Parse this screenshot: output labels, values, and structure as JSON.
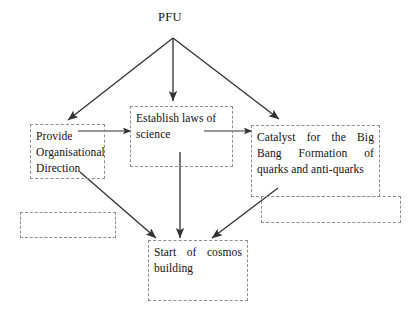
{
  "diagram": {
    "title": "PFU",
    "background_color": "#ffffff",
    "line_color": "#333333",
    "box_border_color": "#8d8d8d",
    "text_color": "#111111",
    "nodes": [
      {
        "id": "pfu",
        "label": "PFU"
      },
      {
        "id": "provide",
        "label": "Provide Organisational Direction"
      },
      {
        "id": "establish",
        "label": "Establish laws of science"
      },
      {
        "id": "catalyst",
        "label": "Catalyst for the Big Bang Formation of quarks and anti-quarks"
      },
      {
        "id": "start",
        "label": "Start of cosmos building"
      },
      {
        "id": "empty-left",
        "label": ""
      },
      {
        "id": "empty-right",
        "label": ""
      }
    ],
    "edges": [
      {
        "from": "pfu",
        "to": "provide"
      },
      {
        "from": "pfu",
        "to": "establish"
      },
      {
        "from": "pfu",
        "to": "catalyst"
      },
      {
        "from": "provide",
        "to": "establish"
      },
      {
        "from": "establish",
        "to": "catalyst"
      },
      {
        "from": "provide",
        "to": "start"
      },
      {
        "from": "establish",
        "to": "start"
      },
      {
        "from": "catalyst",
        "to": "start"
      }
    ]
  }
}
